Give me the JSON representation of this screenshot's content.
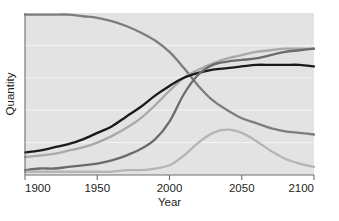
{
  "chart_data": {
    "type": "line",
    "title": "",
    "xlabel": "Year",
    "ylabel": "Quantity",
    "xlim": [
      1900,
      2100
    ],
    "ylim": [
      0,
      100
    ],
    "grid": "horizontal",
    "legend_position": "none",
    "xticks": [
      "1900",
      "1950",
      "2000",
      "2050",
      "2100"
    ],
    "xtick_values": [
      1900,
      1950,
      2000,
      2050,
      2100
    ],
    "yticks": [],
    "plot_background": "#e3e3e3",
    "gridline_color": "#f4f4f4",
    "x": [
      1900,
      1910,
      1920,
      1930,
      1940,
      1950,
      1960,
      1970,
      1980,
      1990,
      2000,
      2010,
      2020,
      2030,
      2040,
      2050,
      2060,
      2070,
      2080,
      2090,
      2100
    ],
    "series": [
      {
        "name": "declining-series",
        "color": "#7d7d7d",
        "width": 2.3,
        "values": [
          99,
          99,
          99,
          99,
          98,
          97,
          95,
          92,
          88,
          83,
          76,
          66,
          55,
          46,
          40,
          35,
          32,
          29,
          27,
          26,
          25
        ]
      },
      {
        "name": "rising-series-light-gray",
        "color": "#a8a8a8",
        "width": 2.3,
        "values": [
          11,
          12,
          13,
          15,
          17,
          20,
          24,
          29,
          35,
          43,
          52,
          60,
          65,
          69,
          72,
          74,
          76,
          77,
          78,
          78,
          78
        ]
      },
      {
        "name": "rising-series-black",
        "color": "#1a1a1a",
        "width": 2.3,
        "values": [
          14,
          15,
          17,
          19,
          22,
          26,
          30,
          36,
          42,
          49,
          55,
          60,
          63,
          65,
          66,
          67,
          68,
          68,
          68,
          68,
          67
        ]
      },
      {
        "name": "late-rising-series",
        "color": "#6b6b6b",
        "width": 2.3,
        "values": [
          3,
          4,
          4,
          5,
          6,
          7,
          9,
          12,
          16,
          22,
          33,
          50,
          62,
          68,
          70,
          71,
          72,
          74,
          76,
          77,
          78
        ]
      },
      {
        "name": "peaking-series",
        "color": "#b5b5b5",
        "width": 2.3,
        "values": [
          2,
          2,
          2,
          2,
          2,
          2,
          2,
          3,
          3,
          4,
          6,
          12,
          20,
          26,
          28,
          26,
          21,
          15,
          10,
          7,
          5
        ]
      }
    ]
  }
}
